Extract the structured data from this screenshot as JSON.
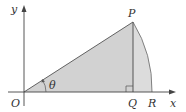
{
  "diagram": {
    "type": "geometry",
    "labels": {
      "y_axis": "y",
      "x_axis": "x",
      "origin": "O",
      "point_p": "P",
      "point_q": "Q",
      "point_r": "R",
      "angle": "θ"
    },
    "colors": {
      "fill": "#d9d9d9",
      "stroke": "#555555",
      "axis": "#444444"
    }
  }
}
